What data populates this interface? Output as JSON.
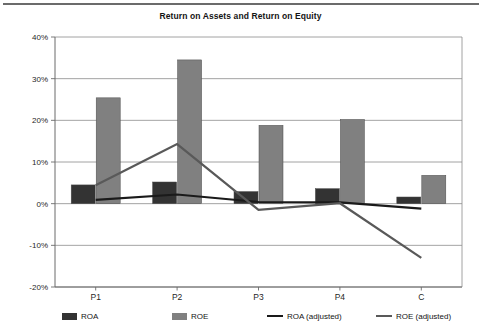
{
  "chart_data": {
    "type": "bar",
    "title": "Return on Assets and Return on Equity",
    "xlabel": "",
    "ylabel": "",
    "ylim": [
      -20,
      40
    ],
    "ytick_values": [
      40,
      30,
      20,
      10,
      0,
      -10,
      -20
    ],
    "ytick_labels": [
      "40%",
      "30%",
      "20%",
      "10%",
      "0%",
      "-10%",
      "-20%"
    ],
    "grid": true,
    "legend_position": "bottom",
    "categories": [
      "P1",
      "P2",
      "P3",
      "P4",
      "C"
    ],
    "series": [
      {
        "name": "ROA",
        "type": "bar",
        "color": "#333333",
        "values": [
          4.5,
          5.2,
          2.9,
          3.6,
          1.6
        ]
      },
      {
        "name": "ROE",
        "type": "bar",
        "color": "#808080",
        "values": [
          25.4,
          34.5,
          18.8,
          20.2,
          6.8
        ]
      },
      {
        "name": "ROA (adjusted)",
        "type": "line",
        "color": "#1a1a1a",
        "values": [
          0.9,
          2.2,
          0.4,
          0.3,
          -1.2
        ]
      },
      {
        "name": "ROE (adjusted)",
        "type": "line",
        "color": "#595959",
        "values": [
          4.4,
          14.3,
          -1.5,
          0.1,
          -13.0
        ]
      }
    ]
  },
  "legend": {
    "items": [
      {
        "label": "ROA",
        "swatch": "bar",
        "color": "#333333"
      },
      {
        "label": "ROE",
        "swatch": "bar",
        "color": "#808080"
      },
      {
        "label": "ROA (adjusted)",
        "swatch": "line",
        "color": "#1a1a1a"
      },
      {
        "label": "ROE (adjusted)",
        "swatch": "line",
        "color": "#595959"
      }
    ]
  }
}
